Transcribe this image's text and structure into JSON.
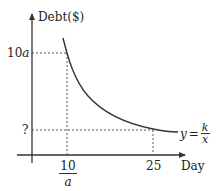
{
  "diagram": {
    "y_axis_label": "Debt($)",
    "x_axis_label": "Day",
    "y_ticks": [
      {
        "label_num": "10",
        "label_var": "a",
        "position": "upper"
      },
      {
        "label": "?",
        "position": "lower"
      }
    ],
    "x_ticks": [
      {
        "numerator": "10",
        "denominator": "a"
      },
      {
        "label": "25"
      }
    ],
    "curve_label": {
      "lhs": "y",
      "eq": "=",
      "numerator": "k",
      "denominator": "x"
    },
    "line_color": "#333333"
  }
}
